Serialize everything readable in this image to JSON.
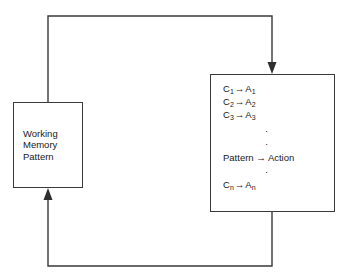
{
  "diagram": {
    "stroke_color": "#3a3a3a",
    "text_color": "#1a1a1a",
    "background_color": "#ffffff",
    "working_memory": {
      "lines": [
        "Working",
        "Memory",
        "Pattern"
      ]
    },
    "production_rules": {
      "rules": [
        {
          "condition": "C",
          "condition_sub": "1",
          "arrow": "→",
          "action": "A",
          "action_sub": "1"
        },
        {
          "condition": "C",
          "condition_sub": "2",
          "arrow": "→",
          "action": "A",
          "action_sub": "2"
        },
        {
          "condition": "C",
          "condition_sub": "3",
          "arrow": "→",
          "action": "A",
          "action_sub": "3"
        }
      ],
      "ellipsis_dot": "·",
      "generic_rule": "Pattern → Action",
      "last_rule": {
        "condition": "C",
        "condition_sub": "n",
        "arrow": "→",
        "action": "A",
        "action_sub": "n"
      }
    },
    "connectors": {
      "top_to_rules_label": "working memory to production rules",
      "rules_to_memory_label": "production rules to working memory"
    }
  }
}
